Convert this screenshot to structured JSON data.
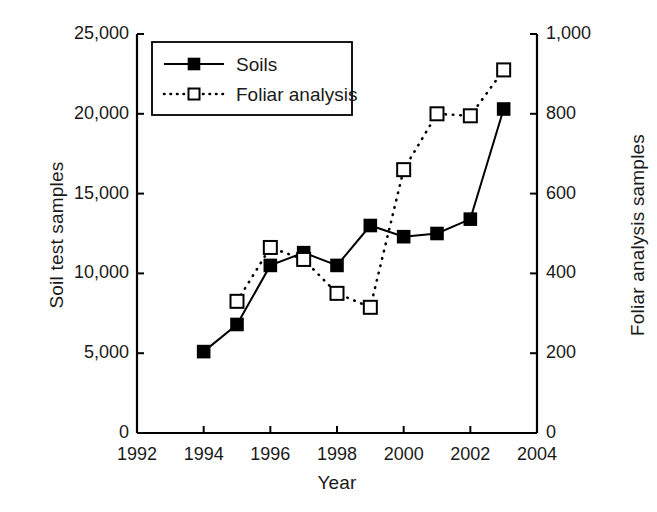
{
  "chart_data": {
    "type": "line",
    "title": "",
    "xlabel": "Year",
    "ylabel": "Soil test samples",
    "ylabel_secondary": "Foliar analysis samples",
    "xlim": [
      1992,
      2004
    ],
    "ylim": [
      0,
      25000
    ],
    "ylim_secondary": [
      0,
      1000
    ],
    "grid": false,
    "legend_position": "upper left",
    "x_ticks": [
      1992,
      1994,
      1996,
      1998,
      2000,
      2002,
      2004
    ],
    "x_tick_labels": [
      "1992",
      "1994",
      "1996",
      "1998",
      "2000",
      "2002",
      "2004"
    ],
    "y_ticks": [
      0,
      5000,
      10000,
      15000,
      20000,
      25000
    ],
    "y_tick_labels": [
      "0",
      "5,000",
      "10,000",
      "15,000",
      "20,000",
      "25,000"
    ],
    "y_ticks_secondary": [
      0,
      200,
      400,
      600,
      800,
      1000
    ],
    "y_tick_labels_secondary": [
      "0",
      "200",
      "400",
      "600",
      "800",
      "1,000"
    ],
    "series": [
      {
        "name": "Soils",
        "axis": "left",
        "marker": "filled-square",
        "linestyle": "solid",
        "color": "#000000",
        "x": [
          1994,
          1995,
          1996,
          1997,
          1998,
          1999,
          2000,
          2001,
          2002,
          2003
        ],
        "values": [
          5100,
          6800,
          10500,
          11300,
          10500,
          13000,
          12300,
          12500,
          13400,
          20300
        ]
      },
      {
        "name": "Foliar analysis",
        "axis": "right",
        "marker": "open-square",
        "linestyle": "dotted",
        "color": "#000000",
        "x": [
          1995,
          1996,
          1997,
          1998,
          1999,
          2000,
          2001,
          2002,
          2003
        ],
        "values": [
          330,
          465,
          435,
          350,
          315,
          660,
          800,
          795,
          910
        ]
      }
    ]
  },
  "legend": {
    "entries": [
      {
        "label": "Soils"
      },
      {
        "label": "Foliar analysis"
      }
    ]
  },
  "axes": {
    "x_title": "Year",
    "y_title_left": "Soil test samples",
    "y_title_right": "Foliar analysis samples"
  },
  "colors": {
    "ink": "#1a1a1a",
    "line": "#000000",
    "background": "#ffffff"
  }
}
